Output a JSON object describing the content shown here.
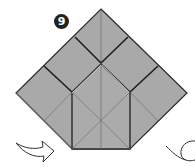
{
  "step": {
    "number": "9"
  },
  "colors": {
    "paper": "#a9a9a9",
    "edge": "#2a2a2a",
    "crease": "#6f6f6f",
    "badge": "#222222",
    "arrow": "#333333",
    "background": "#ffffff"
  },
  "diagram": {
    "arrows": [
      {
        "name": "fold-arrow",
        "direction": "right",
        "position": "bottom-left"
      },
      {
        "name": "turn-over-arrow",
        "position": "bottom-right"
      }
    ]
  }
}
